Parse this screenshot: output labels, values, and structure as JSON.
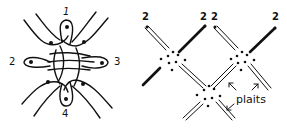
{
  "figure_left": {
    "labels": [
      "1",
      "2",
      "3",
      "4"
    ],
    "description": "Knot/loop diagram with four dotted loops numbered 1-4 and interlaced strands"
  },
  "figure_right": {
    "labels": {
      "top_left": "2",
      "top_mid_a": "2",
      "top_mid_b": "2",
      "top_right": "2",
      "annotation": "plaits"
    },
    "description": "Lattice of crossing double lines (plaits) meeting at dotted nodes"
  },
  "colors": {
    "ink": "#111111",
    "background": "#ffffff"
  }
}
